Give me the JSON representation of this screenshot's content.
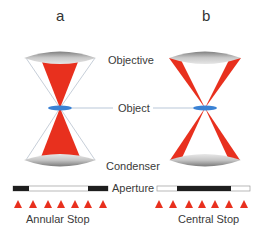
{
  "panels": [
    {
      "id": "a",
      "title": "a",
      "stop_label": "Annular Stop",
      "stop_type": "annular"
    },
    {
      "id": "b",
      "title": "b",
      "stop_label": "Central Stop",
      "stop_type": "central"
    }
  ],
  "labels": {
    "objective": "Objective",
    "object": "Object",
    "condenser": "Condenser",
    "aperture": "Aperture"
  },
  "colors": {
    "light_cone": "#e8301e",
    "lens": "#9a9a9a",
    "object": "#3b82d4",
    "stop_bar": "#1e1e1e",
    "guide_line": "#b9c7d8"
  },
  "triangles_per_row": 7
}
